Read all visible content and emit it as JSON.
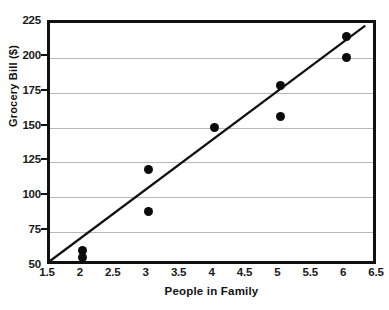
{
  "chart_data": {
    "type": "scatter",
    "title": "",
    "xlabel": "People in Family",
    "ylabel": "Grocery Bill ($)",
    "xlim": [
      1.5,
      6.5
    ],
    "ylim": [
      50,
      225
    ],
    "xticks": [
      "1.5",
      "2",
      "2.5",
      "3",
      "3.5",
      "4",
      "4.5",
      "5",
      "5.5",
      "6",
      "6.5"
    ],
    "xtick_values": [
      1.5,
      2,
      2.5,
      3,
      3.5,
      4,
      4.5,
      5,
      5.5,
      6,
      6.5
    ],
    "yticks": [
      "50",
      "75",
      "100",
      "125",
      "150",
      "175",
      "200",
      "225"
    ],
    "ytick_values": [
      50,
      75,
      100,
      125,
      150,
      175,
      200,
      225
    ],
    "grid": "horizontal",
    "legend": "none",
    "point_color": "#0b0b0b",
    "line_color": "#111111",
    "grid_color": "#b8b8b8",
    "frame_color": "#111111",
    "points": [
      {
        "x": 2,
        "y": 62
      },
      {
        "x": 2,
        "y": 57
      },
      {
        "x": 3,
        "y": 120
      },
      {
        "x": 3,
        "y": 90
      },
      {
        "x": 4,
        "y": 150
      },
      {
        "x": 5,
        "y": 180
      },
      {
        "x": 5,
        "y": 158
      },
      {
        "x": 6,
        "y": 215
      },
      {
        "x": 6,
        "y": 200
      }
    ],
    "trendline": {
      "x_start": 1.5,
      "y_start": 50,
      "x_end": 6.38,
      "y_end": 223
    }
  }
}
